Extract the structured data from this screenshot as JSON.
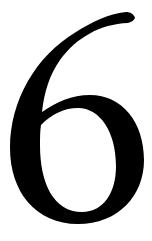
{
  "figure": {
    "character": "6",
    "colors": {
      "glyph": "#000000",
      "background": "#ffffff"
    }
  }
}
